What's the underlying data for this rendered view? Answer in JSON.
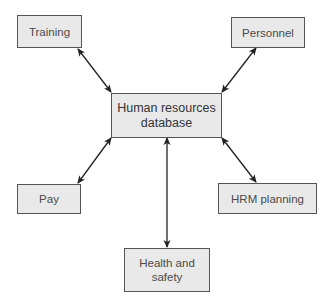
{
  "diagram": {
    "type": "hub-and-spoke",
    "colors": {
      "box_fill": "#e9e9e9",
      "box_border": "#555555",
      "text": "#4a4a4a",
      "arrow": "#222222",
      "background": "#ffffff"
    },
    "center": {
      "label": "Human resources\ndatabase"
    },
    "nodes": [
      {
        "id": "training",
        "label": "Training"
      },
      {
        "id": "personnel",
        "label": "Personnel"
      },
      {
        "id": "pay",
        "label": "Pay"
      },
      {
        "id": "hrm-planning",
        "label": "HRM planning"
      },
      {
        "id": "health-and-safety",
        "label": "Health and\nsafety"
      }
    ],
    "edges": [
      {
        "from": "training",
        "to": "center",
        "direction": "bidirectional"
      },
      {
        "from": "personnel",
        "to": "center",
        "direction": "bidirectional"
      },
      {
        "from": "pay",
        "to": "center",
        "direction": "bidirectional"
      },
      {
        "from": "hrm-planning",
        "to": "center",
        "direction": "bidirectional"
      },
      {
        "from": "health-and-safety",
        "to": "center",
        "direction": "bidirectional"
      }
    ]
  }
}
